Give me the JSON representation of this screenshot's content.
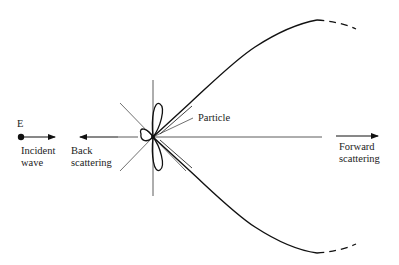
{
  "diagram": {
    "type": "Mie scattering polar pattern",
    "labels": {
      "field": "E",
      "incident_line1": "Incident",
      "incident_line2": "wave",
      "back_line1": "Back",
      "back_line2": "scattering",
      "particle": "Particle",
      "forward_line1": "Forward",
      "forward_line2": "scattering"
    },
    "colors": {
      "stroke": "#111111",
      "thin_stroke": "#333333",
      "background": "#ffffff"
    }
  }
}
